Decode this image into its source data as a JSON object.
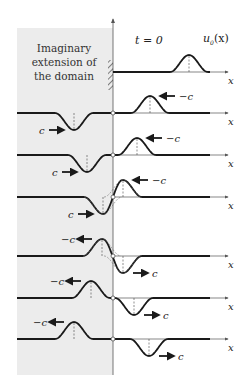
{
  "region_label": [
    "Imaginary",
    "extension of",
    "the domain"
  ],
  "time_label": "t = 0",
  "initial_profile_label": "u",
  "initial_profile_subscript": "0",
  "initial_profile_arg": "(x)",
  "axis_label": "x",
  "colors": {
    "curve": "#1a1a1a",
    "shaded_region": "#ececec",
    "axis": "#555555"
  },
  "rows": [
    {
      "name": "t0",
      "bump_center": 189,
      "trough_center": null,
      "bump_label": null,
      "trough_label": null
    },
    {
      "name": "t1",
      "bump_center": 150,
      "trough_center": 74,
      "bump_label": "−c",
      "trough_label": "c"
    },
    {
      "name": "t2",
      "bump_center": 137,
      "trough_center": 87,
      "bump_label": "−c",
      "trough_label": "c"
    },
    {
      "name": "t3",
      "bump_center": 123,
      "trough_center": 103,
      "bump_label": "−c",
      "trough_label": "c"
    },
    {
      "name": "t4",
      "bump_center": 102,
      "trough_center": 123,
      "bump_label": "−c",
      "trough_label": "c"
    },
    {
      "name": "t5",
      "bump_center": 91,
      "trough_center": 134,
      "bump_label": "−c",
      "trough_label": "c"
    },
    {
      "name": "t6",
      "bump_center": 74,
      "trough_center": 149,
      "bump_label": "−c",
      "trough_label": "c"
    }
  ]
}
